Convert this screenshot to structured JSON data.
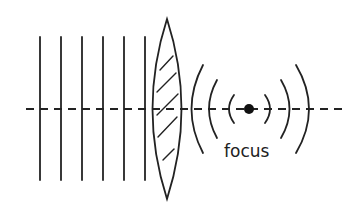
{
  "diagram": {
    "colors": {
      "stroke": "#222222",
      "background": "#ffffff"
    },
    "plane_wavefronts": {
      "count": 6,
      "x_positions": [
        40,
        61,
        82,
        103,
        124,
        145
      ],
      "y_top": 37,
      "y_bottom": 180
    },
    "optical_axis": {
      "y": 109,
      "x_start": 26,
      "x_end": 346,
      "style": "dashed"
    },
    "lens": {
      "type": "biconvex",
      "center_x": 167,
      "top_y": 19,
      "bottom_y": 199,
      "half_width": 17,
      "hatched": true
    },
    "focus_point": {
      "x": 249,
      "y": 109,
      "radius": 5
    },
    "labels": {
      "focus": "focus"
    }
  }
}
